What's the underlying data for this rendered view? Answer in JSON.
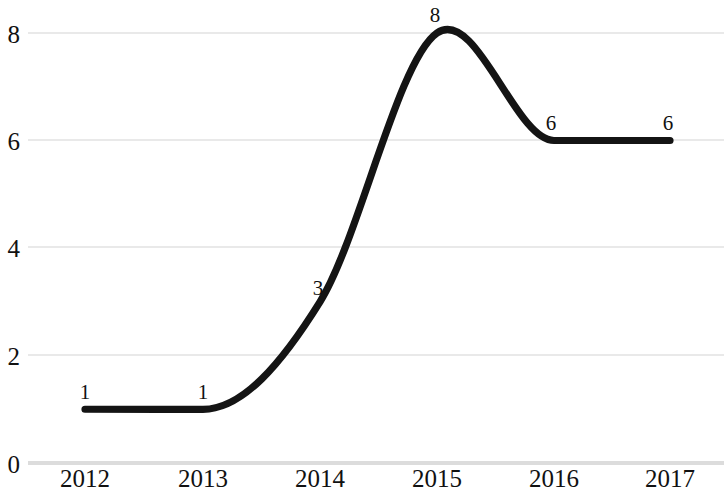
{
  "chart_data": {
    "type": "line",
    "title": "",
    "subtitle": "",
    "xlabel": "",
    "ylabel": "",
    "categories": [
      "2012",
      "2013",
      "2014",
      "2015",
      "2016",
      "2017"
    ],
    "values": [
      1,
      1,
      3,
      8,
      6,
      6
    ],
    "series": [
      {
        "name": "",
        "values": [
          1,
          1,
          3,
          8,
          6,
          6
        ]
      }
    ],
    "point_labels": [
      "1",
      "1",
      "3",
      "8",
      "6",
      "6"
    ],
    "y_ticks": [
      "0",
      "2",
      "4",
      "6",
      "8"
    ],
    "y_tick_values": [
      0,
      2,
      4,
      6,
      8
    ],
    "x_tick_labels": [
      "2012",
      "2013",
      "2014",
      "2015",
      "2016",
      "2017"
    ],
    "ylim": [
      0,
      8
    ],
    "xlim": [
      "2012",
      "2017"
    ],
    "grid": true,
    "grid_axis": "y",
    "legend": false,
    "legend_position": "none",
    "smoothing": "spline",
    "colors": {
      "line": "#141414",
      "grid": "#e9e9e9",
      "axis": "#dcdcdc",
      "text": "#111111",
      "background": "#ffffff"
    },
    "markers": false,
    "data_labels_shown": true
  }
}
